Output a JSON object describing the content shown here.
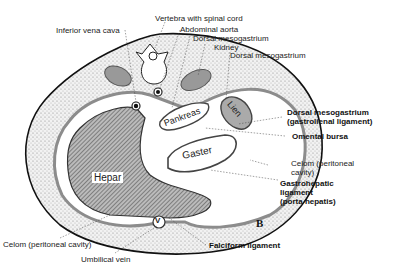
{
  "figure": {
    "panel_letter": "B",
    "organs": {
      "hepar": "Hepar",
      "pankreas": "Pankreas",
      "lien": "Lien",
      "gaster": "Gaster",
      "umbilical_vein_symbol": "V"
    },
    "labels": {
      "inferior_vena_cava": "Inferior vena cava",
      "vertebra": "Vertebra with spinal cord",
      "abdominal_aorta": "Abdominal aorta",
      "dorsal_mesogastrium_1": "Dorsal mesogastrium",
      "kidney": "Kidney",
      "dorsal_mesogastrium_2": "Dorsal mesogastrium",
      "gastrolienal_1": "Dorsal mesogastrium",
      "gastrolienal_2": "(gastrolienal ligament)",
      "omental_bursa": "Omental bursa",
      "celom_right_1": "Celom (peritoneal",
      "celom_right_2": "cavity)",
      "gastrohepatic_1": "Gastrohepatic",
      "gastrohepatic_2": "ligament",
      "gastrohepatic_3": "(porta hepatis)",
      "celom_bottom": "Celom (peritoneal cavity)",
      "umbilical_vein": "Umbilical vein",
      "falciform": "Falciform ligament"
    },
    "colors": {
      "ink": "#111111",
      "stipple": "#d6d6d6",
      "organ_gray": "#9a9a9a",
      "peritoneum": "#8c8c8c"
    }
  }
}
